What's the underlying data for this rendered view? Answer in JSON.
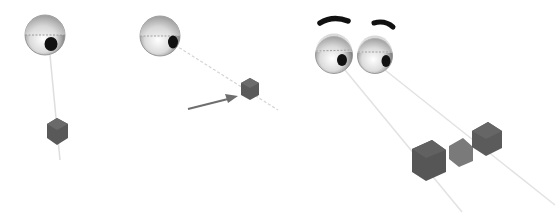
{
  "figure": {
    "colors": {
      "background": "#ffffff",
      "eyeball_light": "#f4f4f4",
      "eyeball_dark": "#7a7a7a",
      "pupil": "#111111",
      "cube_dark": "#555555",
      "cube_mid": "#7a7a7a",
      "gaze_line": "#d8d8d8",
      "arrow": "#6e6e6e",
      "eyebrow": "#111111"
    }
  },
  "panels": [
    {
      "name": "single-eye-looking-down",
      "eyes": 1,
      "cubes": 1
    },
    {
      "name": "single-eye-looking-at-cube-with-arrow",
      "eyes": 1,
      "cubes": 1,
      "arrow": true
    },
    {
      "name": "face-two-eyes-looking-at-three-cubes",
      "eyes": 2,
      "eyebrows": 2,
      "cubes": 3
    }
  ]
}
